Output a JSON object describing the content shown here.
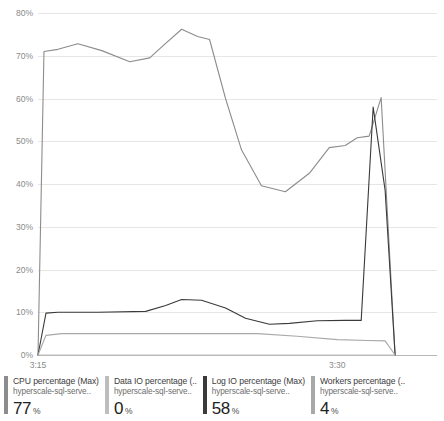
{
  "chart_data": {
    "type": "line",
    "title": "",
    "xlabel": "",
    "ylabel": "",
    "ylim": [
      0,
      80
    ],
    "yticks": [
      "0%",
      "10%",
      "20%",
      "30%",
      "40%",
      "50%",
      "60%",
      "70%",
      "80%"
    ],
    "ytick_values": [
      0,
      10,
      20,
      30,
      40,
      50,
      60,
      70,
      80
    ],
    "xticks": [
      "3:15",
      "3:30"
    ],
    "xtick_positions": [
      0,
      15
    ],
    "xlim": [
      0,
      20
    ],
    "grid": true,
    "legend_position": "bottom",
    "series": [
      {
        "name": "CPU percentage (Max)",
        "color": "#8c8c8c",
        "x": [
          0.0,
          0.3,
          1.0,
          2.0,
          3.2,
          4.6,
          5.6,
          6.3,
          7.2,
          8.0,
          8.6,
          9.4,
          10.2,
          11.2,
          12.4,
          13.6,
          14.6,
          15.4,
          16.0,
          16.6,
          17.2,
          17.9
        ],
        "values": [
          0,
          71,
          71.5,
          72.8,
          71.2,
          68.6,
          69.5,
          72.5,
          76.2,
          74.5,
          73.8,
          60.0,
          48.0,
          39.6,
          38.2,
          42.5,
          48.5,
          49.0,
          50.8,
          51.2,
          60.2,
          0
        ]
      },
      {
        "name": "Data IO percentage (...",
        "color": "#bdbdbd",
        "x": [
          0.0,
          0.3,
          17.9
        ],
        "values": [
          0,
          0,
          0
        ]
      },
      {
        "name": "Log IO percentage (Max)",
        "color": "#3a3a3a",
        "x": [
          0.0,
          0.4,
          1.0,
          3.0,
          5.4,
          6.4,
          7.2,
          8.2,
          9.4,
          10.4,
          11.6,
          12.6,
          14.0,
          15.4,
          16.2,
          16.8,
          17.4,
          17.9
        ],
        "values": [
          0,
          9.8,
          10.0,
          10.0,
          10.2,
          11.6,
          13.0,
          12.8,
          11.0,
          8.6,
          7.2,
          7.4,
          8.0,
          8.1,
          8.1,
          58.0,
          38.5,
          0
        ]
      },
      {
        "name": "Workers percentage (...",
        "color": "#a8a8a8",
        "x": [
          0.0,
          0.4,
          1.2,
          5.0,
          8.0,
          11.0,
          13.0,
          15.0,
          16.5,
          17.4,
          17.9
        ],
        "values": [
          0,
          4.6,
          5.0,
          5.0,
          5.0,
          5.0,
          4.4,
          3.6,
          3.4,
          3.3,
          0
        ]
      }
    ]
  },
  "legend": {
    "items": [
      {
        "title": "CPU percentage (Max)",
        "resource": "hyperscale-sql-serve..",
        "value": "77",
        "unit": "%",
        "color": "#8c8c8c"
      },
      {
        "title": "Data IO percentage (..",
        "resource": "hyperscale-sql-serve..",
        "value": "0",
        "unit": "%",
        "color": "#bdbdbd"
      },
      {
        "title": "Log IO percentage (Max)",
        "resource": "hyperscale-sql-serve..",
        "value": "58",
        "unit": "%",
        "color": "#3a3a3a"
      },
      {
        "title": "Workers percentage (..",
        "resource": "hyperscale-sql-serve..",
        "value": "4",
        "unit": "%",
        "color": "#a8a8a8"
      }
    ]
  }
}
